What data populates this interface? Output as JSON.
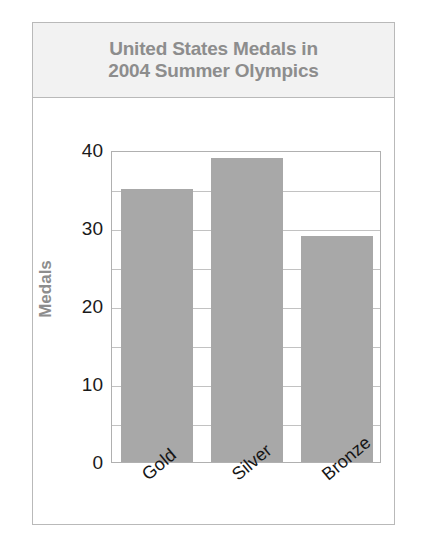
{
  "figure": {
    "title_lines": [
      "United States Medals in",
      "2004 Summer Olympics"
    ],
    "title_text": "United States Medals in 2004 Summer Olympics",
    "colors": {
      "bar_fill": "#a8a8a8",
      "title_text": "#8d8d8d",
      "title_band_background": "#f2f2f2",
      "frame_border": "#b9b9b9",
      "gridline": "#c2c2c2",
      "tick_label": "#1a1a1a"
    }
  },
  "chart_data": {
    "type": "bar",
    "title": "United States Medals in 2004 Summer Olympics",
    "categories": [
      "Gold",
      "Silver",
      "Bronze"
    ],
    "values": [
      35,
      39,
      29
    ],
    "series": [
      {
        "name": "Medals",
        "values": [
          35,
          39,
          29
        ]
      }
    ],
    "xlabel": "",
    "ylabel": "Medals",
    "ylim": [
      0,
      40
    ],
    "yticks": [
      0,
      10,
      20,
      30,
      40
    ],
    "ytick_labels": [
      "0",
      "10",
      "20",
      "30",
      "40"
    ],
    "minor_gridlines": [
      5,
      15,
      25,
      35
    ],
    "grid": true,
    "legend": false,
    "legend_position": "none",
    "bar_color": "#a8a8a8",
    "xtick_rotation": -40
  }
}
